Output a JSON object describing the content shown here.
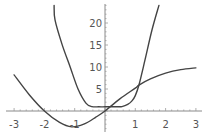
{
  "chart_data": {
    "type": "line",
    "title": "",
    "xlabel": "",
    "ylabel": "",
    "xlim": [
      -3,
      3
    ],
    "ylim": [
      -4,
      24
    ],
    "grid": false,
    "legend": null,
    "x_ticks": [
      -3,
      -2,
      -1,
      1,
      2,
      3
    ],
    "x_tick_labels": [
      "-3",
      "-2",
      "-1",
      "1",
      "2",
      "3"
    ],
    "y_ticks": [
      5,
      10,
      15,
      20
    ],
    "y_tick_labels": [
      "5",
      "10",
      "15",
      "20"
    ],
    "series": [
      {
        "name": "steep curve (flat-bottomed)",
        "color": "#444444",
        "x": [
          -1.68,
          -1.65,
          -1.42,
          -1.15,
          -0.89,
          -0.63,
          -0.43,
          -0.2,
          0.0,
          0.2,
          0.4,
          0.56,
          0.75,
          0.89,
          1.0,
          1.12,
          1.32,
          1.55,
          1.78
        ],
        "y": [
          24,
          20.7,
          15.2,
          10.0,
          5.0,
          1.8,
          1.0,
          0.95,
          0.95,
          0.95,
          0.97,
          1.0,
          1.5,
          2.3,
          3.5,
          5.9,
          11.6,
          18.4,
          24
        ]
      },
      {
        "name": "second curve",
        "color": "#444444",
        "x": [
          -3.0,
          -2.5,
          -2.0,
          -1.5,
          -1.1,
          -0.7,
          -0.3,
          0.0,
          0.5,
          1.0,
          1.12,
          1.5,
          2.0,
          2.5,
          3.0
        ],
        "y": [
          8.2,
          3.7,
          0.0,
          -2.6,
          -3.6,
          -3.0,
          -1.4,
          0.0,
          2.8,
          5.2,
          5.9,
          7.3,
          8.6,
          9.4,
          9.8
        ]
      }
    ],
    "annotations": []
  }
}
